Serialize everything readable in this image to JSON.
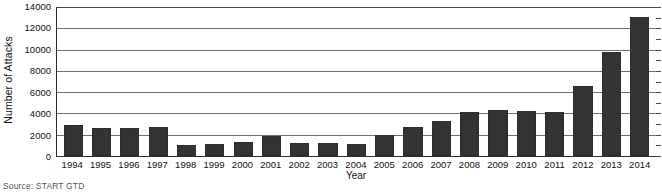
{
  "chart_data": {
    "type": "bar",
    "title": "",
    "xlabel": "Year",
    "ylabel": "Number of Attacks",
    "categories": [
      "1994",
      "1995",
      "1996",
      "1997",
      "1998",
      "1999",
      "2000",
      "2001",
      "2002",
      "2003",
      "2004",
      "2005",
      "2006",
      "2007",
      "2008",
      "2009",
      "2010",
      "2011",
      "2012",
      "2013",
      "2014"
    ],
    "values": [
      2900,
      2600,
      2600,
      2750,
      1000,
      1150,
      1350,
      1900,
      1200,
      1250,
      1150,
      2000,
      2700,
      3250,
      4100,
      4300,
      4200,
      4100,
      6500,
      9700,
      13000
    ],
    "series": [
      {
        "name": "Number of Attacks",
        "values": [
          2900,
          2600,
          2600,
          2750,
          1000,
          1150,
          1350,
          1900,
          1200,
          1250,
          1150,
          2000,
          2700,
          3250,
          4100,
          4300,
          4200,
          4100,
          6500,
          9700,
          13000
        ]
      }
    ],
    "ylim": [
      0,
      14000
    ],
    "yticks": [
      0,
      2000,
      4000,
      6000,
      8000,
      10000,
      12000,
      14000
    ],
    "ytick_labels": [
      "0",
      "2000",
      "4000",
      "6000",
      "8000",
      "10000",
      "12000",
      "14000"
    ],
    "grid": true,
    "grid_axis": "y",
    "legend": false,
    "bar_color": "#333333",
    "grid_color": "#6f6f6f",
    "axis_color": "#2b2b2b"
  },
  "footer": {
    "source": "Source: START GTD"
  }
}
